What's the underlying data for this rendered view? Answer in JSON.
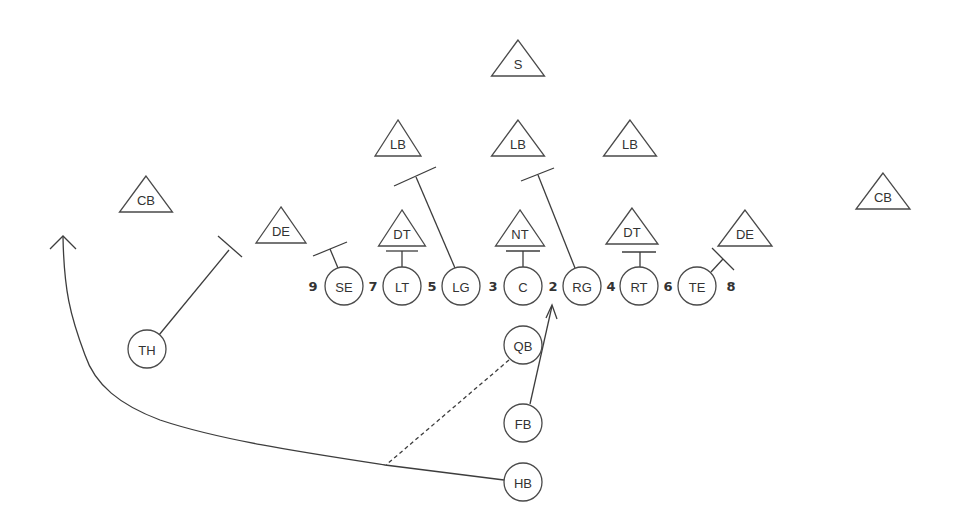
{
  "diagram": {
    "type": "football-play",
    "colors": {
      "stroke": "#4a4a4a",
      "text": "#333333",
      "background": "#ffffff"
    },
    "defense": [
      {
        "id": "s",
        "label": "S",
        "x": 518,
        "y": 40,
        "w": 53
      },
      {
        "id": "lb-l",
        "label": "LB",
        "x": 398,
        "y": 120,
        "w": 46
      },
      {
        "id": "lb-m",
        "label": "LB",
        "x": 518,
        "y": 120,
        "w": 53
      },
      {
        "id": "lb-r",
        "label": "LB",
        "x": 630,
        "y": 120,
        "w": 53
      },
      {
        "id": "cb-l",
        "label": "CB",
        "x": 146,
        "y": 176,
        "w": 53
      },
      {
        "id": "cb-r",
        "label": "CB",
        "x": 883,
        "y": 173,
        "w": 54
      },
      {
        "id": "de-l",
        "label": "DE",
        "x": 281,
        "y": 207,
        "w": 50
      },
      {
        "id": "dt-l",
        "label": "DT",
        "x": 402,
        "y": 210,
        "w": 47
      },
      {
        "id": "nt",
        "label": "NT",
        "x": 520,
        "y": 210,
        "w": 49
      },
      {
        "id": "dt-r",
        "label": "DT",
        "x": 632,
        "y": 208,
        "w": 52
      },
      {
        "id": "de-r",
        "label": "DE",
        "x": 745,
        "y": 210,
        "w": 54
      }
    ],
    "offense": [
      {
        "id": "se",
        "label": "SE",
        "x": 344,
        "y": 286
      },
      {
        "id": "lt",
        "label": "LT",
        "x": 402,
        "y": 286
      },
      {
        "id": "lg",
        "label": "LG",
        "x": 461,
        "y": 286
      },
      {
        "id": "c",
        "label": "C",
        "x": 523,
        "y": 286
      },
      {
        "id": "rg",
        "label": "RG",
        "x": 582,
        "y": 286
      },
      {
        "id": "rt",
        "label": "RT",
        "x": 639,
        "y": 286
      },
      {
        "id": "te",
        "label": "TE",
        "x": 697,
        "y": 286
      },
      {
        "id": "th",
        "label": "TH",
        "x": 147,
        "y": 349
      },
      {
        "id": "qb",
        "label": "QB",
        "x": 523,
        "y": 345
      },
      {
        "id": "fb",
        "label": "FB",
        "x": 523,
        "y": 423
      },
      {
        "id": "hb",
        "label": "HB",
        "x": 523,
        "y": 482
      }
    ],
    "gaps": [
      {
        "label": "9",
        "x": 313,
        "y": 286
      },
      {
        "label": "7",
        "x": 373,
        "y": 286
      },
      {
        "label": "5",
        "x": 432,
        "y": 286
      },
      {
        "label": "3",
        "x": 493,
        "y": 286
      },
      {
        "label": "2",
        "x": 553,
        "y": 286
      },
      {
        "label": "4",
        "x": 611,
        "y": 286
      },
      {
        "label": "6",
        "x": 668,
        "y": 286
      },
      {
        "label": "8",
        "x": 731,
        "y": 286
      }
    ]
  }
}
